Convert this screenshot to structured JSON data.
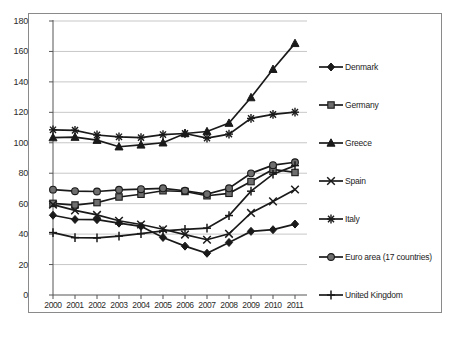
{
  "chart_data": {
    "type": "line",
    "title": "",
    "subtitle": "",
    "xlabel": "",
    "ylabel": "",
    "categories": [
      "2000",
      "2001",
      "2002",
      "2003",
      "2004",
      "2005",
      "2006",
      "2007",
      "2008",
      "2009",
      "2010",
      "2011"
    ],
    "x": [
      2000,
      2001,
      2002,
      2003,
      2004,
      2005,
      2006,
      2007,
      2008,
      2009,
      2010,
      2011
    ],
    "xlim": [
      2000,
      2011
    ],
    "ylim": [
      0,
      180
    ],
    "ytick_step": 20,
    "yticks": [
      0,
      20,
      40,
      60,
      80,
      100,
      120,
      140,
      160,
      180
    ],
    "grid": "horizontal",
    "legend_position": "right",
    "series": [
      {
        "name": "Denmark",
        "marker": "diamond",
        "values": [
          52.4,
          49.6,
          49.5,
          47.2,
          45.1,
          37.8,
          32.1,
          27.4,
          34.5,
          41.8,
          42.9,
          46.6
        ]
      },
      {
        "name": "Germany",
        "marker": "square",
        "values": [
          60.2,
          59.1,
          60.7,
          64.4,
          66.2,
          68.5,
          68.0,
          65.2,
          66.8,
          74.5,
          82.5,
          80.5
        ]
      },
      {
        "name": "Greece",
        "marker": "triangle",
        "values": [
          103.4,
          103.7,
          101.7,
          97.4,
          98.6,
          100.0,
          106.1,
          107.4,
          112.9,
          129.7,
          148.3,
          165.3
        ]
      },
      {
        "name": "Spain",
        "marker": "cross-x",
        "values": [
          59.4,
          55.6,
          52.6,
          48.8,
          46.3,
          43.2,
          39.7,
          36.3,
          40.2,
          53.9,
          61.5,
          69.3
        ]
      },
      {
        "name": "Italy",
        "marker": "asterisk",
        "values": [
          108.5,
          108.2,
          105.1,
          103.9,
          103.4,
          105.4,
          106.1,
          103.1,
          105.7,
          116.0,
          118.6,
          120.1
        ]
      },
      {
        "name": "Euro area (17 countries)",
        "marker": "circle",
        "values": [
          69.2,
          68.2,
          68.0,
          69.1,
          69.5,
          70.1,
          68.5,
          66.3,
          70.1,
          79.9,
          85.3,
          87.2
        ]
      },
      {
        "name": "United Kingdom",
        "marker": "plus",
        "values": [
          41.0,
          37.7,
          37.5,
          38.7,
          40.3,
          42.1,
          43.1,
          43.9,
          52.2,
          68.2,
          79.4,
          85.0
        ]
      }
    ]
  },
  "axes": {
    "y_tick_labels": [
      "180",
      "160",
      "140",
      "120",
      "100",
      "80",
      "60",
      "40",
      "20",
      "0"
    ],
    "x_tick_labels": [
      "2000",
      "2001",
      "2002",
      "2003",
      "2004",
      "2005",
      "2006",
      "2007",
      "2008",
      "2009",
      "2010",
      "2011"
    ]
  },
  "legend": {
    "items": [
      {
        "label": "Denmark",
        "marker": "diamond"
      },
      {
        "label": "Germany",
        "marker": "square"
      },
      {
        "label": "Greece",
        "marker": "triangle"
      },
      {
        "label": "Spain",
        "marker": "cross-x"
      },
      {
        "label": "Italy",
        "marker": "asterisk"
      },
      {
        "label": "Euro area (17 countries)",
        "marker": "circle"
      },
      {
        "label": "United Kingdom",
        "marker": "plus"
      }
    ]
  },
  "colors": {
    "line": "#1a1a1a",
    "marker_fill": "#6e6e6e",
    "grid": "#b9b9b9",
    "frame": "#8a8a8a",
    "text": "#2b2b2b"
  }
}
